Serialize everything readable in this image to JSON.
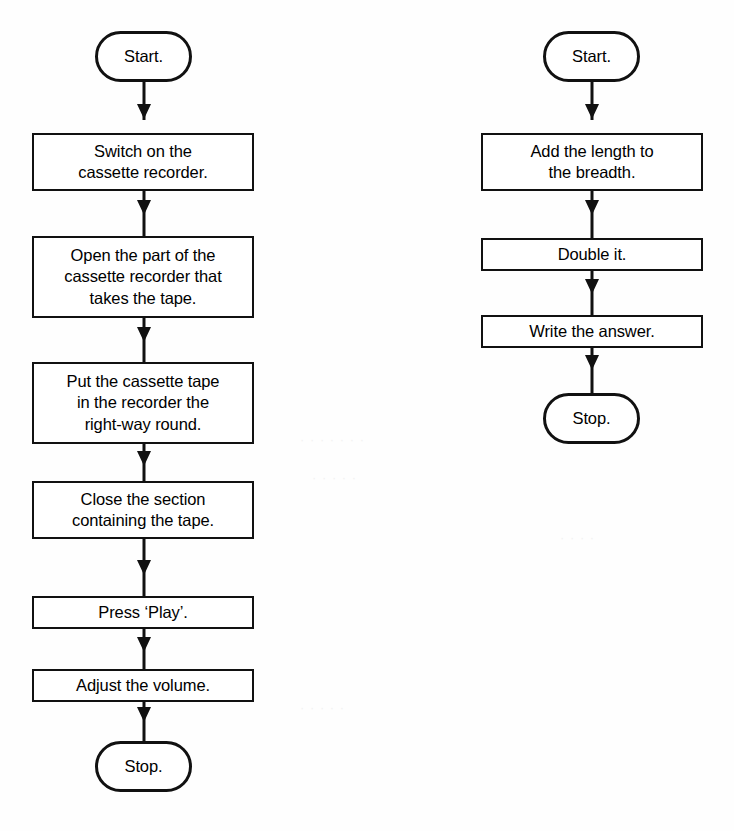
{
  "page": {
    "background_color": "#ffffff",
    "ink_color": "#111111"
  },
  "diagram_data": {
    "type": "flowchart",
    "title": "",
    "orientation": "top-to-bottom",
    "charts": [
      {
        "id": "cassette-recorder-flowchart",
        "description": "Flowchart for operating a cassette recorder",
        "nodes": [
          {
            "id": "l1",
            "shape": "terminal",
            "label": "Start."
          },
          {
            "id": "l2",
            "shape": "process",
            "label": "Switch on the\ncassette recorder."
          },
          {
            "id": "l3",
            "shape": "process",
            "label": "Open the part of the\ncassette recorder that\ntakes the tape."
          },
          {
            "id": "l4",
            "shape": "process",
            "label": "Put the cassette tape\nin the recorder the\nright-way round."
          },
          {
            "id": "l5",
            "shape": "process",
            "label": "Close the section\ncontaining the tape."
          },
          {
            "id": "l6",
            "shape": "process",
            "label": "Press ‘Play’."
          },
          {
            "id": "l7",
            "shape": "process",
            "label": "Adjust the volume."
          },
          {
            "id": "l8",
            "shape": "terminal",
            "label": "Stop."
          }
        ],
        "edges": [
          {
            "from": "l1",
            "to": "l2",
            "arrow": "down"
          },
          {
            "from": "l2",
            "to": "l3",
            "arrow": "down"
          },
          {
            "from": "l3",
            "to": "l4",
            "arrow": "down"
          },
          {
            "from": "l4",
            "to": "l5",
            "arrow": "down"
          },
          {
            "from": "l5",
            "to": "l6",
            "arrow": "down"
          },
          {
            "from": "l6",
            "to": "l7",
            "arrow": "down"
          },
          {
            "from": "l7",
            "to": "l8",
            "arrow": "down"
          }
        ]
      },
      {
        "id": "perimeter-flowchart",
        "description": "Flowchart for calculating the perimeter of a rectangle",
        "nodes": [
          {
            "id": "r1",
            "shape": "terminal",
            "label": "Start."
          },
          {
            "id": "r2",
            "shape": "process",
            "label": "Add the length to\nthe breadth."
          },
          {
            "id": "r3",
            "shape": "process",
            "label": "Double it."
          },
          {
            "id": "r4",
            "shape": "process",
            "label": "Write the answer."
          },
          {
            "id": "r5",
            "shape": "terminal",
            "label": "Stop."
          }
        ],
        "edges": [
          {
            "from": "r1",
            "to": "r2",
            "arrow": "down"
          },
          {
            "from": "r2",
            "to": "r3",
            "arrow": "down"
          },
          {
            "from": "r3",
            "to": "r4",
            "arrow": "down"
          },
          {
            "from": "r4",
            "to": "r5",
            "arrow": "down"
          }
        ]
      }
    ]
  },
  "left_flowchart": {
    "start": {
      "label": "Start."
    },
    "step_1": {
      "line_1": "Switch on the",
      "line_2": "cassette recorder."
    },
    "step_2": {
      "line_1": "Open the part of the",
      "line_2": "cassette recorder that",
      "line_3": "takes the tape."
    },
    "step_3": {
      "line_1": "Put the cassette tape",
      "line_2": "in the recorder the",
      "line_3": "right-way round."
    },
    "step_4": {
      "line_1": "Close the section",
      "line_2": "containing the tape."
    },
    "step_5": {
      "line_1": "Press ‘Play’."
    },
    "step_6": {
      "line_1": "Adjust the volume."
    },
    "stop": {
      "label": "Stop."
    }
  },
  "right_flowchart": {
    "start": {
      "label": "Start."
    },
    "step_1": {
      "line_1": "Add the length to",
      "line_2": "the breadth."
    },
    "step_2": {
      "line_1": "Double it."
    },
    "step_3": {
      "line_1": "Write the answer."
    },
    "stop": {
      "label": "Stop."
    }
  }
}
